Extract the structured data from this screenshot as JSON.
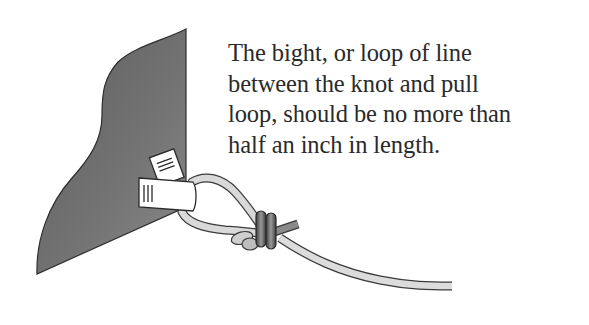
{
  "caption": {
    "lines": [
      "The bight, or loop of line",
      "between the knot and pull",
      "loop, should be no more than",
      "half an inch in length."
    ]
  },
  "illustration": {
    "subject": "container-flap-with-pull-loop-knot",
    "colors": {
      "fabric": "#6e6e6e",
      "fabric_edge": "#2e2e2e",
      "line": "#d9d9d9",
      "line_outline": "#3a3a3a",
      "knot_wrap": "#7a7a7a",
      "tab": "#ffffff"
    }
  }
}
